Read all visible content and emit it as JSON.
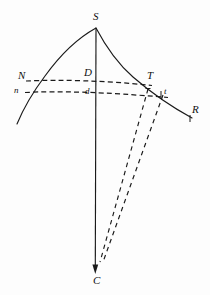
{
  "figure": {
    "background_color": "#fdfdfd",
    "ink_color": "#1a1a1a",
    "width": 210,
    "height": 295
  },
  "labels": {
    "apex": "S",
    "left_upper": "N",
    "left_lower": "n",
    "center_upper": "D",
    "center_lower": "d",
    "right_upper": "T",
    "right_lower": "t",
    "right_end": "R",
    "bottom": "C"
  },
  "geometry": {
    "apex_point": "S",
    "center_point": "C",
    "vertical_axis": "S to C",
    "upper_chord": "N D T",
    "lower_chord": "n d t",
    "rays": [
      "T to C",
      "t to C"
    ],
    "curve_endpoints": [
      "left-lower",
      "R"
    ]
  }
}
